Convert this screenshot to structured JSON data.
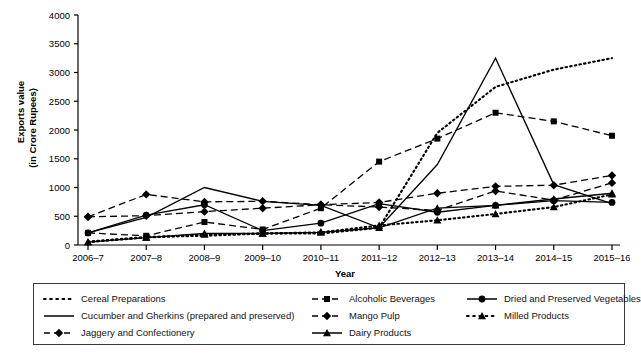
{
  "chart_data": {
    "type": "line",
    "title": "",
    "xlabel": "Year",
    "ylabel": "Exports value\n(in Crore Rupees)",
    "ylabel_line1": "Exports value",
    "ylabel_line2": "(in Crore Rupees)",
    "categories": [
      "2006–7",
      "2007–8",
      "2008–9",
      "2009–10",
      "2010–11",
      "2011–12",
      "2012–13",
      "2013–14",
      "2014–15",
      "2015–16"
    ],
    "yticks": [
      0,
      500,
      1000,
      1500,
      2000,
      2500,
      3000,
      3500,
      4000
    ],
    "ylim": [
      0,
      4000
    ],
    "grid": false,
    "legend_position": "bottom",
    "series": [
      {
        "name": "Cereal Preparations",
        "style": "dotted",
        "marker": "none",
        "values": [
          60,
          140,
          160,
          200,
          200,
          300,
          1950,
          2750,
          3050,
          3250
        ]
      },
      {
        "name": "Cucumber and Gherkins (prepared and preserved)",
        "style": "solid",
        "marker": "none",
        "values": [
          210,
          480,
          1000,
          760,
          690,
          300,
          1400,
          3250,
          1050,
          720
        ]
      },
      {
        "name": "Jaggery and Confectionery",
        "style": "dashed",
        "marker": "diamond",
        "values": [
          490,
          510,
          580,
          640,
          700,
          740,
          900,
          1020,
          1040,
          1210
        ]
      },
      {
        "name": "Alcoholic Beverages",
        "style": "dashed",
        "marker": "square",
        "values": [
          210,
          160,
          400,
          270,
          640,
          1450,
          1850,
          2300,
          2150,
          1900
        ]
      },
      {
        "name": "Mango Pulp",
        "style": "dashed",
        "marker": "diamond",
        "values": [
          490,
          880,
          750,
          760,
          700,
          660,
          600,
          940,
          780,
          1080
        ]
      },
      {
        "name": "Dairy Products",
        "style": "solid",
        "marker": "triangle",
        "values": [
          50,
          130,
          200,
          200,
          220,
          300,
          640,
          690,
          800,
          900
        ]
      },
      {
        "name": "Dried and Preserved Vegetables",
        "style": "solid",
        "marker": "circle",
        "values": [
          210,
          520,
          700,
          250,
          380,
          720,
          570,
          690,
          770,
          740
        ]
      },
      {
        "name": "Milled Products",
        "style": "dotted",
        "marker": "triangle",
        "values": [
          50,
          130,
          180,
          200,
          220,
          340,
          430,
          540,
          660,
          880
        ]
      }
    ]
  },
  "legend": {
    "items": [
      {
        "label": "Cereal Preparations",
        "sample": "dotted-line-sample"
      },
      {
        "label": "Cucumber and Gherkins (prepared and preserved)",
        "sample": "solid-line-sample"
      },
      {
        "label": "Jaggery and Confectionery",
        "sample": "dashed-diamond-sample"
      },
      {
        "label": "Alcoholic Beverages",
        "sample": "dashed-square-sample"
      },
      {
        "label": "Mango Pulp",
        "sample": "dashed-diamond-sample"
      },
      {
        "label": "Dairy Products",
        "sample": "solid-triangle-sample"
      },
      {
        "label": "Dried and Preserved Vegetables",
        "sample": "solid-circle-sample"
      },
      {
        "label": "Milled Products",
        "sample": "dotted-triangle-sample"
      }
    ]
  }
}
